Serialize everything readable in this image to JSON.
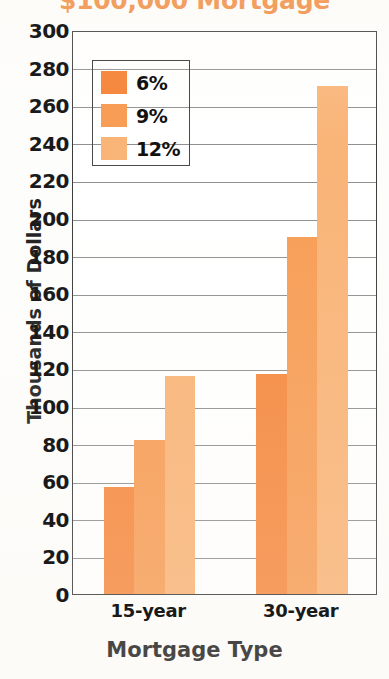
{
  "chart_data": {
    "type": "bar",
    "title": "$100,000 Mortgage",
    "xlabel": "Mortgage Type",
    "ylabel": "Thousands of Dollars",
    "categories": [
      "15-year",
      "30-year"
    ],
    "series": [
      {
        "name": "6%",
        "values": [
          57,
          117
        ],
        "color": "#f5893f"
      },
      {
        "name": "9%",
        "values": [
          82,
          190
        ],
        "color": "#f79d55"
      },
      {
        "name": "12%",
        "values": [
          116,
          270
        ],
        "color": "#f9b477"
      }
    ],
    "ylim": [
      0,
      300
    ],
    "ytick_step": 20,
    "yticks": [
      0,
      20,
      40,
      60,
      80,
      100,
      120,
      140,
      160,
      180,
      200,
      220,
      240,
      260,
      280,
      300
    ],
    "ytick_labels": [
      "0",
      "20",
      "40",
      "60",
      "80",
      "100",
      "120",
      "140",
      "160",
      "180",
      "200",
      "220",
      "240",
      "260",
      "280",
      "300"
    ],
    "grid": true,
    "grid_axis": "y",
    "legend_position": "upper-left-inside",
    "title_color": "#f08a3c",
    "axis_color": "#3a3a3a",
    "text_color": "#1a1a1a"
  },
  "legend": {
    "entries": [
      {
        "label": "6%",
        "color": "#f5893f"
      },
      {
        "label": "9%",
        "color": "#f79d55"
      },
      {
        "label": "12%",
        "color": "#f9b477"
      }
    ]
  }
}
